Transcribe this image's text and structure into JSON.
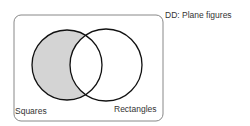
{
  "diagram": {
    "type": "venn",
    "title": "DD:  Plane figures",
    "sets": [
      {
        "label": "Squares",
        "shaded_region": "only"
      },
      {
        "label": "Rectangles"
      }
    ],
    "colors": {
      "shade": "#d4d4d4",
      "stroke": "#111111",
      "box": "#888888"
    }
  }
}
